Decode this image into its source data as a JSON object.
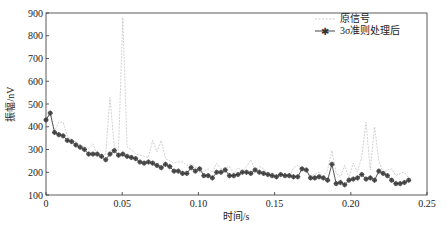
{
  "chart_data": {
    "type": "line",
    "title": "",
    "xlabel": "时间/s",
    "ylabel": "振幅/nV",
    "xlim": [
      0,
      0.25
    ],
    "ylim": [
      100,
      900
    ],
    "xticks": [
      "0",
      "0.05",
      "0.10",
      "0.15",
      "0.20",
      "0.25"
    ],
    "xtick_values": [
      0,
      0.05,
      0.1,
      0.15,
      0.2,
      0.25
    ],
    "yticks": [
      "100",
      "200",
      "300",
      "400",
      "500",
      "600",
      "700",
      "800",
      "900"
    ],
    "ytick_values": [
      100,
      200,
      300,
      400,
      500,
      600,
      700,
      800,
      900
    ],
    "grid": false,
    "legend_position": "upper right",
    "series": [
      {
        "name": "原信号",
        "style": "thin dashed light-gray line",
        "x": [
          0,
          0.0028,
          0.0056,
          0.0084,
          0.0112,
          0.014,
          0.0168,
          0.0196,
          0.0224,
          0.0252,
          0.028,
          0.0308,
          0.0336,
          0.0364,
          0.0392,
          0.042,
          0.0448,
          0.0476,
          0.0504,
          0.0532,
          0.056,
          0.0588,
          0.0616,
          0.0644,
          0.0672,
          0.07,
          0.0728,
          0.0756,
          0.0784,
          0.0812,
          0.084,
          0.0868,
          0.0896,
          0.0924,
          0.0952,
          0.098,
          0.1008,
          0.1036,
          0.1064,
          0.1092,
          0.112,
          0.1148,
          0.1176,
          0.1204,
          0.1232,
          0.126,
          0.1288,
          0.1316,
          0.1344,
          0.1372,
          0.14,
          0.1428,
          0.1456,
          0.1484,
          0.1512,
          0.154,
          0.1568,
          0.1596,
          0.1624,
          0.1652,
          0.168,
          0.1708,
          0.1736,
          0.1764,
          0.1792,
          0.182,
          0.1848,
          0.1876,
          0.1904,
          0.1932,
          0.196,
          0.1988,
          0.2016,
          0.2044,
          0.2072,
          0.21,
          0.2128,
          0.2156,
          0.2184,
          0.2212,
          0.224,
          0.2268,
          0.2296,
          0.2324,
          0.2352,
          0.238
        ],
        "values": [
          430,
          460,
          380,
          420,
          420,
          360,
          340,
          335,
          320,
          310,
          305,
          325,
          280,
          275,
          280,
          530,
          310,
          300,
          880,
          310,
          300,
          280,
          275,
          270,
          265,
          340,
          290,
          340,
          260,
          250,
          240,
          245,
          245,
          230,
          235,
          225,
          200,
          205,
          215,
          200,
          240,
          215,
          220,
          225,
          195,
          220,
          205,
          225,
          255,
          210,
          225,
          215,
          195,
          200,
          180,
          185,
          190,
          175,
          220,
          230,
          215,
          205,
          185,
          190,
          200,
          175,
          210,
          295,
          195,
          180,
          230,
          175,
          240,
          200,
          270,
          420,
          210,
          400,
          250,
          200,
          210,
          215,
          185,
          195,
          200,
          175
        ]
      },
      {
        "name": "3σ准则处理后",
        "style": "dark gray solid line with asterisk markers",
        "x": [
          0,
          0.0028,
          0.0056,
          0.0084,
          0.0112,
          0.014,
          0.0168,
          0.0196,
          0.0224,
          0.0252,
          0.028,
          0.0308,
          0.0336,
          0.0364,
          0.0392,
          0.042,
          0.0448,
          0.0476,
          0.0504,
          0.0532,
          0.056,
          0.0588,
          0.0616,
          0.0644,
          0.0672,
          0.07,
          0.0728,
          0.0756,
          0.0784,
          0.0812,
          0.084,
          0.0868,
          0.0896,
          0.0924,
          0.0952,
          0.098,
          0.1008,
          0.1036,
          0.1064,
          0.1092,
          0.112,
          0.1148,
          0.1176,
          0.1204,
          0.1232,
          0.126,
          0.1288,
          0.1316,
          0.1344,
          0.1372,
          0.14,
          0.1428,
          0.1456,
          0.1484,
          0.1512,
          0.154,
          0.1568,
          0.1596,
          0.1624,
          0.1652,
          0.168,
          0.1708,
          0.1736,
          0.1764,
          0.1792,
          0.182,
          0.1848,
          0.1876,
          0.1904,
          0.1932,
          0.196,
          0.1988,
          0.2016,
          0.2044,
          0.2072,
          0.21,
          0.2128,
          0.2156,
          0.2184,
          0.2212,
          0.224,
          0.2268,
          0.2296,
          0.2324,
          0.2352,
          0.238
        ],
        "values": [
          430,
          460,
          375,
          365,
          360,
          340,
          335,
          320,
          310,
          300,
          280,
          280,
          280,
          270,
          255,
          280,
          295,
          275,
          280,
          270,
          265,
          260,
          245,
          240,
          245,
          240,
          230,
          220,
          235,
          225,
          205,
          205,
          195,
          195,
          220,
          205,
          215,
          185,
          185,
          175,
          200,
          200,
          210,
          185,
          185,
          190,
          200,
          200,
          195,
          210,
          200,
          195,
          190,
          185,
          180,
          190,
          185,
          185,
          180,
          180,
          215,
          210,
          175,
          175,
          180,
          175,
          165,
          235,
          150,
          155,
          145,
          165,
          170,
          175,
          190,
          170,
          175,
          165,
          205,
          195,
          185,
          165,
          150,
          150,
          155,
          165
        ]
      }
    ]
  },
  "legend": {
    "items": [
      {
        "label": "原信号"
      },
      {
        "label": "3σ准则处理后"
      }
    ]
  },
  "axes": {
    "xlabel": "时间/s",
    "ylabel": "振幅/nV"
  }
}
